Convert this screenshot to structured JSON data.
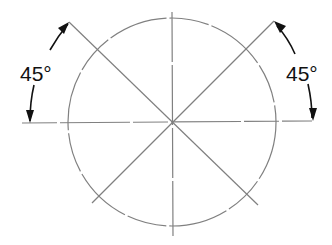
{
  "diagram": {
    "labels": {
      "left_angle": "45°",
      "right_angle": "45°"
    },
    "geometry": {
      "center": [
        172,
        122
      ],
      "radius": 104,
      "line_color": "#777777",
      "arrow_color": "#111111"
    }
  }
}
